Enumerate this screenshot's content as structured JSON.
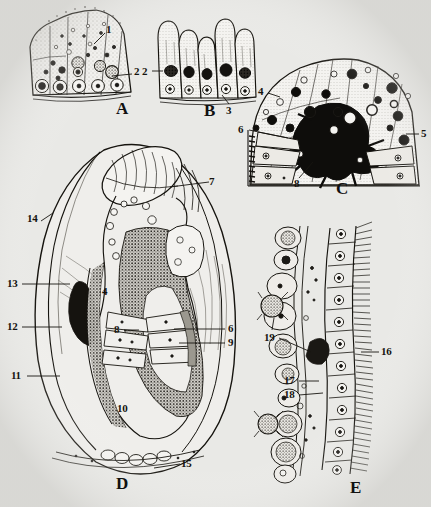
{
  "figure": {
    "type": "multi-panel histological plate",
    "background_color": "#e9e9e6",
    "ink_color": "#181612",
    "caption": "",
    "panels": [
      {
        "letter": "A",
        "name": "panel-a",
        "subject": "stippled columnar epithelium block with basal nuclei and granular secretory cells",
        "letter_x": 118,
        "letter_y": 101,
        "callouts": [
          {
            "num": "1",
            "x": 108,
            "y": 28,
            "lx1": 104,
            "ly1": 34,
            "lx2": 94,
            "ly2": 44
          },
          {
            "num": "2",
            "x": 134,
            "y": 70,
            "lx1": 132,
            "ly1": 74,
            "lx2": 112,
            "ly2": 76
          }
        ]
      },
      {
        "letter": "B",
        "name": "panel-b",
        "subject": "isolated columnar cells with dark apical secretion masses and round basal nuclei",
        "letter_x": 206,
        "letter_y": 103,
        "callouts": [
          {
            "num": "2",
            "x": 143,
            "y": 68,
            "lx1": 151,
            "ly1": 72,
            "lx2": 162,
            "ly2": 72
          },
          {
            "num": "3",
            "x": 228,
            "y": 106,
            "lx1": 228,
            "ly1": 104,
            "lx2": 221,
            "ly2": 95
          }
        ]
      },
      {
        "letter": "C",
        "name": "panel-c",
        "subject": "dome-shaped apical organ with dense black granule mass and radiating cells",
        "letter_x": 337,
        "letter_y": 182,
        "callouts": [
          {
            "num": "4",
            "x": 259,
            "y": 90,
            "lx1": 267,
            "ly1": 93,
            "lx2": 279,
            "ly2": 97
          },
          {
            "num": "5",
            "x": 421,
            "y": 130,
            "lx1": 419,
            "ly1": 134,
            "lx2": 408,
            "ly2": 134
          },
          {
            "num": "6",
            "x": 240,
            "y": 126,
            "lx1": 248,
            "ly1": 130,
            "lx2": 285,
            "ly2": 137
          },
          {
            "num": "8",
            "x": 294,
            "y": 181,
            "lx1": 298,
            "ly1": 178,
            "lx2": 312,
            "ly2": 163
          }
        ]
      },
      {
        "letter": "D",
        "name": "panel-d",
        "subject": "whole sagittal section of larva showing gut loop, mantle folds and foot",
        "letter_x": 120,
        "letter_y": 478,
        "callouts": [
          {
            "num": "7",
            "x": 210,
            "y": 178,
            "lx1": 208,
            "ly1": 182,
            "lx2": 170,
            "ly2": 186
          },
          {
            "num": "14",
            "x": 28,
            "y": 217,
            "lx1": 40,
            "ly1": 221,
            "lx2": 52,
            "ly2": 214
          },
          {
            "num": "13",
            "x": 8,
            "y": 280,
            "lx1": 22,
            "ly1": 284,
            "lx2": 68,
            "ly2": 284
          },
          {
            "num": "12",
            "x": 8,
            "y": 323,
            "lx1": 22,
            "ly1": 327,
            "lx2": 60,
            "ly2": 327
          },
          {
            "num": "11",
            "x": 12,
            "y": 372,
            "lx1": 26,
            "ly1": 376,
            "lx2": 58,
            "ly2": 376
          },
          {
            "num": "4",
            "x": 103,
            "y": 288,
            "lx1": 0,
            "ly1": 0,
            "lx2": 0,
            "ly2": 0
          },
          {
            "num": "8",
            "x": 115,
            "y": 326,
            "lx1": 123,
            "ly1": 330,
            "lx2": 138,
            "ly2": 330
          },
          {
            "num": "6",
            "x": 228,
            "y": 325,
            "lx1": 226,
            "ly1": 329,
            "lx2": 175,
            "ly2": 329
          },
          {
            "num": "9",
            "x": 228,
            "y": 339,
            "lx1": 226,
            "ly1": 343,
            "lx2": 180,
            "ly2": 343
          },
          {
            "num": "10",
            "x": 119,
            "y": 405,
            "lx1": 0,
            "ly1": 0,
            "lx2": 0,
            "ly2": 0
          },
          {
            "num": "15",
            "x": 182,
            "y": 460,
            "lx1": 181,
            "ly1": 464,
            "lx2": 155,
            "ly2": 468
          }
        ]
      },
      {
        "letter": "E",
        "name": "panel-e",
        "subject": "ciliated gill epithelium in section with subepithelial granular cells and free amoebocytes",
        "letter_x": 352,
        "letter_y": 482,
        "callouts": [
          {
            "num": "19",
            "x": 266,
            "y": 334,
            "lx1": 278,
            "ly1": 338,
            "lx2": 310,
            "ly2": 352
          },
          {
            "num": "16",
            "x": 382,
            "y": 348,
            "lx1": 380,
            "ly1": 352,
            "lx2": 362,
            "ly2": 352
          },
          {
            "num": "17",
            "x": 286,
            "y": 377,
            "lx1": 298,
            "ly1": 381,
            "lx2": 318,
            "ly2": 381
          },
          {
            "num": "18",
            "x": 286,
            "y": 391,
            "lx1": 298,
            "ly1": 395,
            "lx2": 322,
            "ly2": 393
          }
        ]
      }
    ],
    "label_numbers": [
      "1",
      "2",
      "3",
      "4",
      "5",
      "6",
      "7",
      "8",
      "9",
      "10",
      "11",
      "12",
      "13",
      "14",
      "15",
      "16",
      "17",
      "18",
      "19"
    ]
  }
}
